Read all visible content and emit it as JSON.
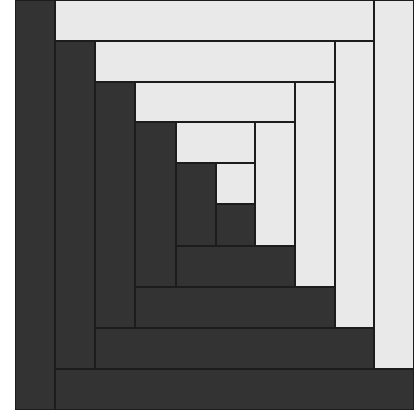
{
  "block": {
    "type": "log-cabin-quilt-block",
    "colors": {
      "dark": "#333333",
      "light": "#e9e9e9",
      "seam": "#1c1c1c",
      "background": "#ffffff"
    },
    "bounds": {
      "x": 15,
      "y": 0,
      "width": 399,
      "height": 410
    }
  },
  "strips": [
    {
      "name": "ring5-left",
      "tone": "dark",
      "x": 15,
      "y": 0,
      "w": 40,
      "h": 410
    },
    {
      "name": "ring5-top",
      "tone": "light",
      "x": 55,
      "y": 0,
      "w": 319,
      "h": 41
    },
    {
      "name": "ring5-right",
      "tone": "light",
      "x": 374,
      "y": 0,
      "w": 40,
      "h": 369
    },
    {
      "name": "ring5-bottom",
      "tone": "dark",
      "x": 55,
      "y": 369,
      "w": 359,
      "h": 41
    },
    {
      "name": "ring4-left",
      "tone": "dark",
      "x": 55,
      "y": 41,
      "w": 40,
      "h": 328
    },
    {
      "name": "ring4-top",
      "tone": "light",
      "x": 95,
      "y": 41,
      "w": 240,
      "h": 41
    },
    {
      "name": "ring4-right",
      "tone": "light",
      "x": 335,
      "y": 41,
      "w": 39,
      "h": 287
    },
    {
      "name": "ring4-bottom",
      "tone": "dark",
      "x": 95,
      "y": 328,
      "w": 279,
      "h": 41
    },
    {
      "name": "ring3-left",
      "tone": "dark",
      "x": 95,
      "y": 82,
      "w": 40,
      "h": 246
    },
    {
      "name": "ring3-top",
      "tone": "light",
      "x": 135,
      "y": 82,
      "w": 160,
      "h": 40
    },
    {
      "name": "ring3-right",
      "tone": "light",
      "x": 295,
      "y": 82,
      "w": 40,
      "h": 205
    },
    {
      "name": "ring3-bottom",
      "tone": "dark",
      "x": 135,
      "y": 287,
      "w": 200,
      "h": 41
    },
    {
      "name": "ring2-left",
      "tone": "dark",
      "x": 135,
      "y": 122,
      "w": 41,
      "h": 165
    },
    {
      "name": "ring2-top",
      "tone": "light",
      "x": 176,
      "y": 122,
      "w": 79,
      "h": 41
    },
    {
      "name": "ring2-right",
      "tone": "light",
      "x": 255,
      "y": 122,
      "w": 40,
      "h": 124
    },
    {
      "name": "ring2-bottom",
      "tone": "dark",
      "x": 176,
      "y": 246,
      "w": 119,
      "h": 41
    },
    {
      "name": "ring1-left",
      "tone": "dark",
      "x": 176,
      "y": 163,
      "w": 40,
      "h": 83
    },
    {
      "name": "ring1-top",
      "tone": "light",
      "x": 216,
      "y": 163,
      "w": 39,
      "h": 41
    },
    {
      "name": "center",
      "tone": "dark",
      "x": 216,
      "y": 204,
      "w": 39,
      "h": 42
    }
  ]
}
